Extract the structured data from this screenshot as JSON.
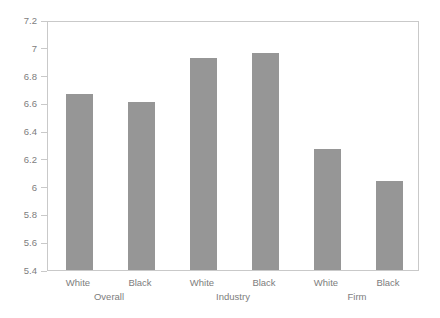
{
  "chart_data": {
    "type": "bar",
    "title": "",
    "subtitle": "",
    "xlabel": "",
    "ylabel": "",
    "ylim": [
      5.4,
      7.2
    ],
    "ytick_labels": [
      "7.2",
      "7",
      "6.8",
      "6.6",
      "6.4",
      "6.2",
      "6",
      "5.8",
      "5.6",
      "5.4"
    ],
    "ytick_values": [
      7.2,
      7.0,
      6.8,
      6.6,
      6.4,
      6.2,
      6.0,
      5.8,
      5.6,
      5.4
    ],
    "grid": false,
    "legend": "none",
    "categories": [
      "White",
      "Black",
      "White",
      "Black",
      "White",
      "Black"
    ],
    "values": [
      6.67,
      6.61,
      6.93,
      6.96,
      6.27,
      6.04
    ],
    "groups": [
      {
        "label": "Overall",
        "categories": [
          "White",
          "Black"
        ],
        "values": [
          6.67,
          6.61
        ]
      },
      {
        "label": "Industry",
        "categories": [
          "White",
          "Black"
        ],
        "values": [
          6.93,
          6.96
        ]
      },
      {
        "label": "Firm",
        "categories": [
          "White",
          "Black"
        ],
        "values": [
          6.27,
          6.04
        ]
      }
    ],
    "group_labels": [
      "Overall",
      "Industry",
      "Firm"
    ],
    "bar_color": "#969696",
    "axis_color": "#c9c9c9",
    "tick_label_color": "#7d7d7d",
    "background": "#ffffff"
  }
}
